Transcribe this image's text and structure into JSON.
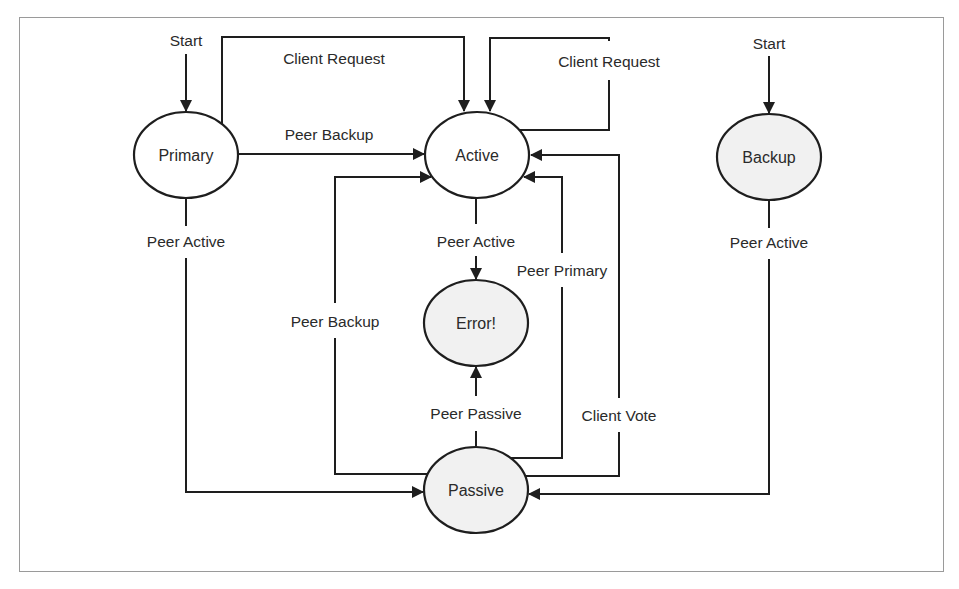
{
  "diagram": {
    "type": "state-machine",
    "colors": {
      "stroke": "#1e1e1e",
      "text": "#2a2a2a",
      "node_fill_plain": "#ffffff",
      "node_fill_shaded": "#f1f1f1",
      "frame": "#9a9a9a"
    },
    "nodes": {
      "primary": {
        "label": "Primary",
        "cx": 186,
        "cy": 155,
        "shaded": false
      },
      "active": {
        "label": "Active",
        "cx": 477,
        "cy": 155,
        "shaded": false
      },
      "backup": {
        "label": "Backup",
        "cx": 769,
        "cy": 157,
        "shaded": true
      },
      "error": {
        "label": "Error!",
        "cx": 476,
        "cy": 323,
        "shaded": true
      },
      "passive": {
        "label": "Passive",
        "cx": 476,
        "cy": 490,
        "shaded": true
      }
    },
    "start_labels": {
      "primary_start": "Start",
      "backup_start": "Start"
    },
    "edges": [
      {
        "id": "primary-to-active-client-request",
        "from": "Primary",
        "to": "Active",
        "label": "Client Request"
      },
      {
        "id": "primary-to-active-peer-backup",
        "from": "Primary",
        "to": "Active",
        "label": "Peer Backup"
      },
      {
        "id": "active-self-client-request",
        "from": "Active",
        "to": "Active",
        "label": "Client Request"
      },
      {
        "id": "primary-to-passive-peer-active",
        "from": "Primary",
        "to": "Passive",
        "label": "Peer Active"
      },
      {
        "id": "backup-to-passive-peer-active",
        "from": "Backup",
        "to": "Passive",
        "label": "Peer Active"
      },
      {
        "id": "active-to-error-peer-active",
        "from": "Active",
        "to": "Error!",
        "label": "Peer Active"
      },
      {
        "id": "passive-to-error-peer-passive",
        "from": "Passive",
        "to": "Error!",
        "label": "Peer Passive"
      },
      {
        "id": "passive-to-active-peer-backup",
        "from": "Passive",
        "to": "Active",
        "label": "Peer Backup"
      },
      {
        "id": "passive-to-active-peer-primary",
        "from": "Passive",
        "to": "Active",
        "label": "Peer Primary"
      },
      {
        "id": "passive-to-active-client-vote",
        "from": "Passive",
        "to": "Active",
        "label": "Client Vote"
      }
    ]
  }
}
